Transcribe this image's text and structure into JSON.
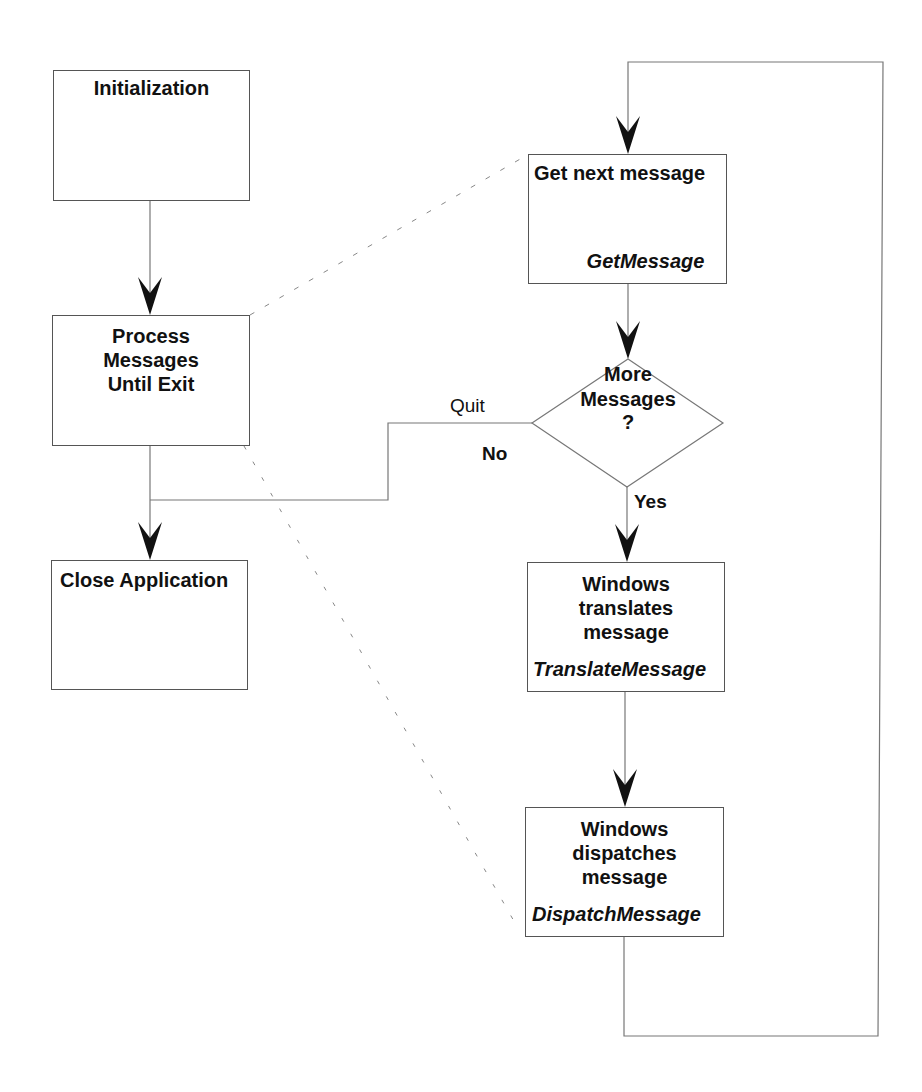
{
  "diagram": {
    "type": "flowchart",
    "title": "",
    "nodes": {
      "initialization": {
        "label": "Initialization"
      },
      "process": {
        "lines": [
          "Process",
          "Messages",
          "Until Exit"
        ]
      },
      "close": {
        "label": "Close Application"
      },
      "get_message": {
        "label": "Get next message",
        "function": "GetMessage"
      },
      "decision": {
        "lines": [
          "More",
          "Messages",
          "?"
        ]
      },
      "translate": {
        "lines": [
          "Windows",
          "translates",
          "message"
        ],
        "function": "TranslateMessage"
      },
      "dispatch": {
        "lines": [
          "Windows",
          "dispatches",
          "message"
        ],
        "function": "DispatchMessage"
      }
    },
    "edge_labels": {
      "quit": "Quit",
      "no": "No",
      "yes": "Yes"
    },
    "edges": [
      {
        "from": "initialization",
        "to": "process",
        "style": "solid-arrow"
      },
      {
        "from": "process",
        "to": "close",
        "style": "solid-arrow"
      },
      {
        "from": "get_message",
        "to": "decision",
        "style": "solid-arrow"
      },
      {
        "from": "decision",
        "to": "translate",
        "style": "solid-arrow",
        "label": "Yes"
      },
      {
        "from": "decision",
        "to": "close",
        "style": "solid-arrow",
        "label": "Quit / No"
      },
      {
        "from": "translate",
        "to": "dispatch",
        "style": "solid-arrow"
      },
      {
        "from": "dispatch",
        "to": "get_message",
        "style": "loop-arrow"
      },
      {
        "from": "process",
        "to": "get_message",
        "style": "dashed-expansion"
      },
      {
        "from": "process",
        "to": "dispatch",
        "style": "dashed-expansion"
      }
    ],
    "colors": {
      "line": "#777777",
      "arrow": "#111111",
      "text": "#111111",
      "background": "#ffffff"
    }
  }
}
